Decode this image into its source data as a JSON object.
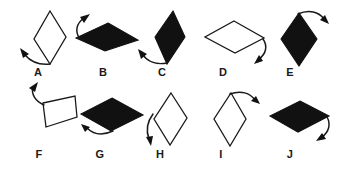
{
  "figure": {
    "background_color": "#ffffff",
    "stroke_color": "#1a1a1a",
    "fill_black": "#111111",
    "fill_white": "#ffffff",
    "width": 339,
    "height": 174
  },
  "items": [
    {
      "label": "A",
      "fill": "white",
      "orientation": "tall",
      "arrow": "curves down-left from bottom vertex",
      "label_x": 38,
      "label_y": 68,
      "shape_points": "50,11 66,36 50,64 34,40",
      "arrow_path": "M 49,64 C 38,64 30,60 25,54",
      "arrow_head": "22,50 31,53 26,58"
    },
    {
      "label": "B",
      "fill": "black",
      "orientation": "wide",
      "arrow": "curves up-left from left vertex",
      "label_x": 103,
      "label_y": 68,
      "shape_points": "107,23 137,39 104,50 76,38",
      "arrow_path": "M 79,38 C 76,31 79,24 85,20",
      "arrow_head": "90,16 86,25 81,20"
    },
    {
      "label": "C",
      "fill": "black",
      "orientation": "tall",
      "arrow": "curves down-left from bottom vertex",
      "label_x": 162,
      "label_y": 68,
      "shape_points": "172,11 184,36 168,64 155,38",
      "arrow_path": "M 167,63 C 157,64 149,60 144,54",
      "arrow_head": "141,50 150,53 145,58"
    },
    {
      "label": "D",
      "fill": "white",
      "orientation": "wide",
      "arrow": "curves down-right from right vertex",
      "label_x": 223,
      "label_y": 68,
      "shape_points": "233,21 263,38 234,53 205,38"
    },
    {
      "label": "E",
      "fill": "black",
      "orientation": "tall",
      "arrow": "curves up-right from top vertex",
      "label_x": 290,
      "label_y": 68,
      "shape_points": "299,13 317,38 299,66 281,39"
    },
    {
      "label": "F",
      "fill": "white",
      "orientation": "wide",
      "arrow": "curves up-left from left vertex",
      "label_x": 39,
      "label_y": 150,
      "shape_points": "41,103 74,97 76,117 46,127"
    },
    {
      "label": "G",
      "fill": "black",
      "orientation": "wide",
      "arrow": "curves down-left from bottom vertex",
      "label_x": 100,
      "label_y": 150,
      "shape_points": "111,98 142,115 111,131 81,114"
    },
    {
      "label": "H",
      "fill": "white",
      "orientation": "tall",
      "arrow": "curves down-left along left edge",
      "label_x": 160,
      "label_y": 150,
      "shape_points": "170,93 186,118 170,145 154,119"
    },
    {
      "label": "I",
      "fill": "white",
      "orientation": "tall",
      "arrow": "curves up-right from top vertex",
      "label_x": 221,
      "label_y": 150,
      "shape_points": "230,93 245,119 230,146 214,119"
    },
    {
      "label": "J",
      "fill": "black",
      "orientation": "wide",
      "arrow": "curves down-right from right vertex",
      "label_x": 290,
      "label_y": 150,
      "shape_points": "299,101 328,116 298,132 270,117"
    }
  ]
}
